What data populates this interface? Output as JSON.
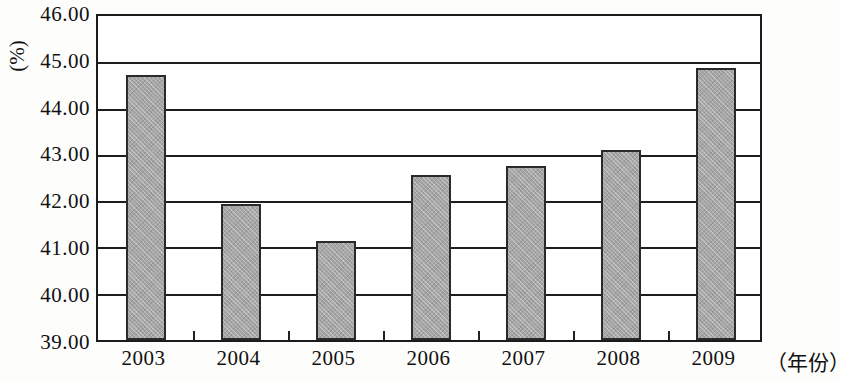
{
  "chart_data": {
    "type": "bar",
    "title": "",
    "subtitle": "",
    "xlabel": "（年份）",
    "ylabel": "(%)",
    "categories": [
      "2003",
      "2004",
      "2005",
      "2006",
      "2007",
      "2008",
      "2009"
    ],
    "values": [
      44.72,
      41.93,
      41.15,
      42.57,
      42.75,
      43.1,
      44.88
    ],
    "series": [
      {
        "name": "",
        "values": [
          44.72,
          41.93,
          41.15,
          42.57,
          42.75,
          43.1,
          44.88
        ]
      }
    ],
    "ylim": [
      39.0,
      46.0
    ],
    "ytick_labels": [
      "46.00",
      "45.00",
      "44.00",
      "43.00",
      "42.00",
      "41.00",
      "40.00",
      "39.00"
    ],
    "ytick_values": [
      46.0,
      45.0,
      44.0,
      43.0,
      42.0,
      41.0,
      40.0,
      39.0
    ],
    "grid": true,
    "legend": false,
    "legend_position": "none",
    "bar_color": "#a6a6a6",
    "bar_border_color": "#2a2a2a",
    "axis_color": "#1b1b1b",
    "background_color": "#ffffff",
    "annotations": []
  },
  "axes": {
    "y_unit": "(%)",
    "x_unit": "（年份）"
  }
}
